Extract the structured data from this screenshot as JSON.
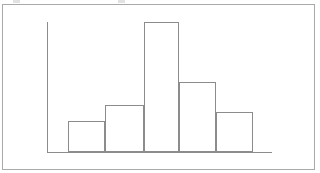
{
  "figure": {
    "background_color": "#ffffff",
    "border_color": "#a9a9a9",
    "line_color": "#8c8c8c",
    "axis_color": "#8c8c8c",
    "bar_fill": "none",
    "title": "",
    "caption": ""
  },
  "chart_data": {
    "type": "bar",
    "title": "",
    "subtitle": "",
    "xlabel": "",
    "ylabel": "",
    "categories": [
      "1",
      "2",
      "3",
      "4",
      "5"
    ],
    "values": [
      31,
      47,
      130,
      70,
      40
    ],
    "series": [
      {
        "name": "frequency",
        "values": [
          31,
          47,
          130,
          70,
          40
        ]
      }
    ],
    "bin_edges": [
      68,
      105,
      144,
      179,
      216,
      253
    ],
    "xlim": [
      47,
      272
    ],
    "ylim": [
      0,
      130
    ],
    "grid": false,
    "legend": null,
    "legend_position": "none",
    "xtick_labels": [],
    "ytick_labels": [],
    "annotations": [],
    "style": "unfilled outlined histogram bars on plain axes"
  },
  "geometry": {
    "border": {
      "x": 2,
      "y": 4,
      "width": 313,
      "height": 166
    },
    "y_axis": {
      "x": 47,
      "y_top": 22,
      "y_bottom": 152
    },
    "x_axis": {
      "y": 152,
      "x_left": 47,
      "x_right": 272
    },
    "bars": [
      {
        "name": "bar-1",
        "x": 68,
        "width": 37,
        "top": 121,
        "height": 31
      },
      {
        "name": "bar-2",
        "x": 105,
        "width": 39,
        "top": 105,
        "height": 47
      },
      {
        "name": "bar-3",
        "x": 144,
        "width": 35,
        "top": 22,
        "height": 130
      },
      {
        "name": "bar-4",
        "x": 179,
        "width": 37,
        "top": 82,
        "height": 70
      },
      {
        "name": "bar-5",
        "x": 216,
        "width": 37,
        "top": 112,
        "height": 40
      }
    ]
  },
  "artifacts": {
    "top_left_mark": "",
    "top_mid_mark": ""
  }
}
